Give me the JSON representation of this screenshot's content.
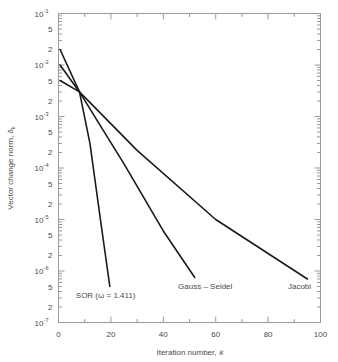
{
  "chart_data": {
    "type": "line",
    "title": "",
    "xlabel": "Iteration number, k",
    "ylabel": "Vector change norm, δ",
    "ylabel_sub": "k",
    "xlabel_main": "Iteration number,",
    "xlabel_italic": "k",
    "xscale": "linear",
    "yscale": "log",
    "xlim": [
      0,
      100
    ],
    "ylim": [
      1e-07,
      0.1
    ],
    "grid": false,
    "legend_position": "inline-annotations",
    "xticks": [
      0,
      20,
      40,
      60,
      80,
      100
    ],
    "xtick_labels": [
      "0",
      "20",
      "40",
      "60",
      "80",
      "100"
    ],
    "xminor_step": 10,
    "ymajor_ticks": [
      0.1,
      0.01,
      0.001,
      0.0001,
      1e-05,
      1e-06,
      1e-07
    ],
    "ymajor_labels": [
      "10⁻¹",
      "10⁻²",
      "10⁻³",
      "10⁻⁴",
      "10⁻⁵",
      "10⁻⁶",
      "10⁻⁷"
    ],
    "ymajor_mantissa": [
      "10",
      "10",
      "10",
      "10",
      "10",
      "10",
      "10"
    ],
    "ymajor_exponent": [
      "-1",
      "-2",
      "-3",
      "-4",
      "-5",
      "-6",
      "-7"
    ],
    "yminor_labeled": [
      "5",
      "2"
    ],
    "series": [
      {
        "name": "SOR (ω = 1.411)",
        "label": "SOR (ω = 1.411)",
        "label_x": 18,
        "label_y": 3e-07,
        "points": [
          {
            "k": 0.6,
            "d": 0.02
          },
          {
            "k": 8.0,
            "d": 0.003
          },
          {
            "k": 12.0,
            "d": 0.0003
          },
          {
            "k": 16.0,
            "d": 1e-05
          },
          {
            "k": 19.6,
            "d": 5e-07
          }
        ]
      },
      {
        "name": "Gauss – Seidel",
        "label": "Gauss – Seidel",
        "label_x": 56,
        "label_y": 4.5e-07,
        "points": [
          {
            "k": 0.6,
            "d": 0.01
          },
          {
            "k": 8.0,
            "d": 0.003
          },
          {
            "k": 25.0,
            "d": 0.00012
          },
          {
            "k": 40.0,
            "d": 6e-06
          },
          {
            "k": 52.0,
            "d": 7.5e-07
          }
        ]
      },
      {
        "name": "Jacobi",
        "label": "Jacobi",
        "label_x": 92,
        "label_y": 4.5e-07,
        "points": [
          {
            "k": 0.6,
            "d": 0.005
          },
          {
            "k": 8.0,
            "d": 0.003
          },
          {
            "k": 30.0,
            "d": 0.00022
          },
          {
            "k": 60.0,
            "d": 1e-05
          },
          {
            "k": 95.0,
            "d": 7e-07
          }
        ]
      }
    ]
  }
}
